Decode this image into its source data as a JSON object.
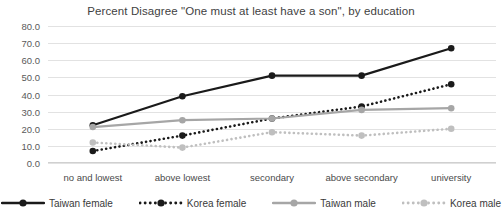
{
  "chart_data": {
    "type": "line",
    "title": "Percent Disagree \"One must at least have a son\", by education",
    "xlabel": "",
    "ylabel": "",
    "ylim": [
      0,
      80
    ],
    "ytick_step": 10,
    "grid": true,
    "legend_position": "bottom",
    "categories": [
      "no and lowest",
      "above lowest",
      "secondary",
      "above secondary",
      "university"
    ],
    "ytick_labels": [
      "80.0",
      "70.0",
      "60.0",
      "50.0",
      "40.0",
      "30.0",
      "20.0",
      "10.0",
      "0.0"
    ],
    "series": [
      {
        "name": "Taiwan female",
        "values": [
          22.0,
          39.0,
          51.0,
          51.0,
          67.0
        ],
        "color": "#1a1a1a",
        "style": "solid",
        "marker": "circle"
      },
      {
        "name": "Korea female",
        "values": [
          7.0,
          16.0,
          26.0,
          33.0,
          46.0
        ],
        "color": "#1a1a1a",
        "style": "dotted",
        "marker": "circle"
      },
      {
        "name": "Taiwan male",
        "values": [
          21.0,
          25.0,
          26.0,
          31.0,
          32.0
        ],
        "color": "#a6a6a6",
        "style": "solid",
        "marker": "circle"
      },
      {
        "name": "Korea male",
        "values": [
          12.0,
          9.0,
          18.0,
          16.0,
          20.0
        ],
        "color": "#bfbfbf",
        "style": "dotted",
        "marker": "circle"
      }
    ]
  }
}
